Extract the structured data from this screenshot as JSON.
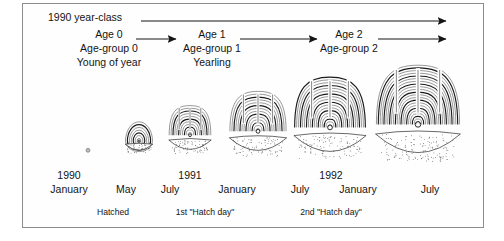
{
  "figure": {
    "background": "#ffffff",
    "frame_color": "#8c8c8c",
    "ink_color": "#141414"
  },
  "timeline": {
    "year_class": {
      "label": "1990  year-class",
      "label_x": 48,
      "label_y": 17,
      "arrow": {
        "x1": 141,
        "y1": 21,
        "x2": 446,
        "y2": 21
      }
    },
    "age_stages": [
      {
        "age_label": "Age 0",
        "group_label": "Age-group 0",
        "stage_label": "Young of year",
        "center_x": 109,
        "age_y": 34,
        "group_y": 48,
        "stage_y": 62,
        "arrow": {
          "x1": 136,
          "y1": 39,
          "x2": 176,
          "y2": 39
        }
      },
      {
        "age_label": "Age 1",
        "group_label": "Age-group 1",
        "stage_label": "Yearling",
        "center_x": 212,
        "age_y": 34,
        "group_y": 48,
        "stage_y": 62,
        "arrow": {
          "x1": 240,
          "y1": 39,
          "x2": 317,
          "y2": 39
        }
      },
      {
        "age_label": "Age 2",
        "group_label": "Age-group 2",
        "stage_label": "",
        "center_x": 349,
        "age_y": 34,
        "group_y": 48,
        "stage_y": 62,
        "arrow": {
          "x1": 378,
          "y1": 39,
          "x2": 446,
          "y2": 39
        }
      }
    ]
  },
  "otoliths": [
    {
      "name": "otolith-1990-may",
      "center_x": 88,
      "baseline_y": 152,
      "size": 4,
      "rings": 1,
      "shape": "dot",
      "lobes": 0,
      "has_base": false
    },
    {
      "name": "otolith-1990-july",
      "center_x": 139,
      "baseline_y": 152,
      "size": 26,
      "rings": 7,
      "shape": "round",
      "lobes": 0,
      "has_base": true
    },
    {
      "name": "otolith-1991-january",
      "center_x": 190,
      "baseline_y": 152,
      "size": 40,
      "rings": 11,
      "shape": "lobed",
      "lobes": 3,
      "has_base": true
    },
    {
      "name": "otolith-1991-july",
      "center_x": 258,
      "baseline_y": 154,
      "size": 54,
      "rings": 14,
      "shape": "lobed",
      "lobes": 3,
      "has_base": true
    },
    {
      "name": "otolith-1992-january",
      "center_x": 330,
      "baseline_y": 156,
      "size": 68,
      "rings": 18,
      "shape": "lobed",
      "lobes": 3,
      "has_base": true
    },
    {
      "name": "otolith-1992-july",
      "center_x": 418,
      "baseline_y": 158,
      "size": 80,
      "rings": 22,
      "shape": "lobed",
      "lobes": 3,
      "has_base": true
    }
  ],
  "time_axis": {
    "years": [
      {
        "label": "1990",
        "x": 69,
        "y": 175
      },
      {
        "label": "1991",
        "x": 190,
        "y": 175
      },
      {
        "label": "1992",
        "x": 331,
        "y": 175
      }
    ],
    "months": [
      {
        "label": "January",
        "x": 69,
        "y": 189
      },
      {
        "label": "May",
        "x": 126,
        "y": 189
      },
      {
        "label": "July",
        "x": 170,
        "y": 189
      },
      {
        "label": "January",
        "x": 237,
        "y": 189
      },
      {
        "label": "July",
        "x": 300,
        "y": 189
      },
      {
        "label": "January",
        "x": 358,
        "y": 189
      },
      {
        "label": "July",
        "x": 430,
        "y": 189
      }
    ]
  },
  "events": [
    {
      "label": "Hatched",
      "x": 113,
      "y": 211
    },
    {
      "label": "1st \"Hatch day\"",
      "x": 205,
      "y": 211
    },
    {
      "label": "2nd \"Hatch day\"",
      "x": 331,
      "y": 211
    }
  ]
}
